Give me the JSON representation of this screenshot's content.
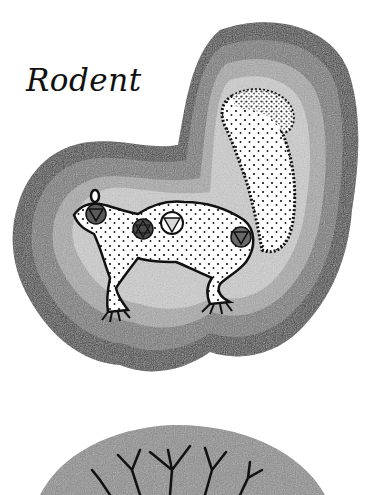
{
  "page": {
    "title": "Rodent"
  },
  "illustration": {
    "subject": "squirrel",
    "aura_bands": [
      "#3a3a3a",
      "#6e6e6e",
      "#9a9a9a",
      "#c6c6c6",
      "#8a8a8a"
    ],
    "body_fill": "#ffffff",
    "stipple_color": "#111111",
    "symbols": [
      {
        "name": "head-chakra",
        "glyph": "triangle-down",
        "fill": "#5a5a5a"
      },
      {
        "name": "throat-chakra",
        "glyph": "hexagram",
        "fill": "#4a4a4a"
      },
      {
        "name": "heart-chakra",
        "glyph": "triangle-down",
        "fill": "#e0e0e0"
      },
      {
        "name": "root-chakra",
        "glyph": "triangle-down",
        "fill": "#6a6a6a"
      }
    ]
  },
  "next_illustration": {
    "subject": "tree-branches",
    "fill": "#8c8c8c"
  }
}
